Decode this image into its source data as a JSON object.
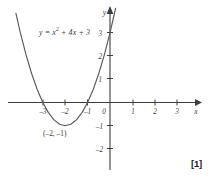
{
  "figure": {
    "equation_label": {
      "lhs": "y = ",
      "base": "x",
      "exponent": "2",
      "rest": " + 4x + 3",
      "full": "y = x² + 4x + 3"
    },
    "vertex_label": "(–2, –1)",
    "marks": "[1]",
    "x_axis_name": "x",
    "y_axis_name": "y"
  },
  "chart_data": {
    "type": "line",
    "title": "",
    "subtitle": "",
    "xlabel": "x",
    "ylabel": "y",
    "xlim": [
      -4.9,
      4.4
    ],
    "ylim": [
      -2.9,
      3.5
    ],
    "grid": false,
    "legend": null,
    "function": "y = x^2 + 4x + 3",
    "series": [
      {
        "name": "y = x² + 4x + 3",
        "color": "#5a5a5a",
        "x": [
          -4.45,
          -4.2,
          -4.0,
          -3.75,
          -3.5,
          -3.25,
          -3.0,
          -2.75,
          -2.5,
          -2.25,
          -2.0,
          -1.75,
          -1.5,
          -1.25,
          -1.0,
          -0.75,
          -0.5,
          -0.25,
          0.0,
          0.25,
          0.45
        ],
        "y": [
          3.0,
          1.84,
          3.0,
          2.0625,
          1.25,
          0.5625,
          0.0,
          -0.4375,
          -0.75,
          -0.9375,
          -1.0,
          -0.9375,
          -0.75,
          -0.4375,
          0.0,
          0.5625,
          1.25,
          2.0625,
          3.0,
          4.0625,
          5.0
        ]
      }
    ],
    "x_ticks": [
      -3,
      -2,
      -1,
      0,
      1,
      2,
      3
    ],
    "x_tick_labels": [
      "–3",
      "–2",
      "–1",
      "0",
      "1",
      "2",
      "3"
    ],
    "y_ticks": [
      -2,
      -1,
      1,
      2,
      3
    ],
    "y_tick_labels": [
      "–2",
      "–1",
      "1",
      "2",
      "3"
    ],
    "annotations": [
      {
        "text": "y = x² + 4x + 3",
        "x": -1.1,
        "y": 2.7
      },
      {
        "text": "(–2, –1)",
        "x": -2.0,
        "y": -1.4
      }
    ],
    "roots": [
      -3,
      -1
    ],
    "vertex": [
      -2,
      -1
    ],
    "y_intercept": 3,
    "axis_color": "#3d3d3d",
    "curve_color": "#5a5a5a",
    "background": "#ffffff"
  }
}
